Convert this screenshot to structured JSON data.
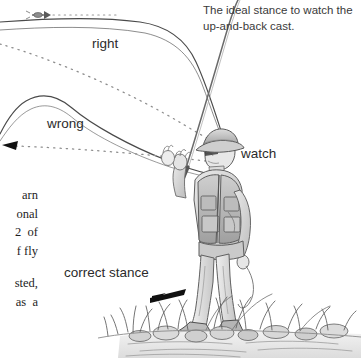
{
  "figure": {
    "kind": "fly-fishing instructional line drawing",
    "medium": "graphite pencil sketch, grayscale on white",
    "caption": "The ideal stance to watch the up-and-back cast."
  },
  "labels": {
    "right": "right",
    "wrong": "wrong",
    "watch": "watch",
    "correct_stance": "correct stance"
  },
  "body_text_cropped": {
    "block_one": [
      "arn",
      "onal",
      "2  of",
      "f fly"
    ],
    "block_two": [
      "sted,",
      "as  a"
    ]
  },
  "colors": {
    "page_background": "#ffffff",
    "ink": "#2b2b2b",
    "body_ink": "#1d1d1d",
    "caption_ink": "#3a3a3a",
    "line_stroke": "#4a4a4a",
    "dotted_stroke": "#8d8d8d",
    "arrow_fill": "#111111",
    "shading_light": "#d6d6d6",
    "shading_mid": "#a8a8a8",
    "shading_dark": "#6e6e6e"
  },
  "scene_elements": {
    "angler": "angler in brimmed hat and fly vest, rod raised up and back",
    "rod": "fly rod flexing to upper right",
    "upper_loop": "correct line loop labelled right",
    "lower_loop": "incorrect line loop labelled wrong",
    "fly": "fly at tip of line, upper left",
    "dotted_paths": "dotted trajectory lines showing line travel",
    "ground": "grass tufts, rocks and water at the bank",
    "foot_arrow": "solid black arrow pointing to the feet"
  }
}
